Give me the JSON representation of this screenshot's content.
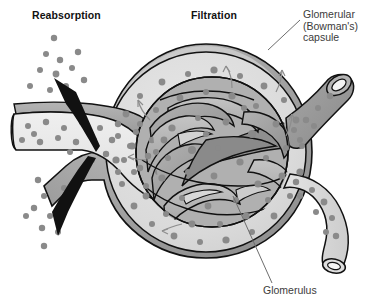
{
  "figure": {
    "background_color": "#ffffff",
    "width": 377,
    "height": 306
  },
  "labels": {
    "reabsorption": "Reabsorption",
    "filtration": "Filtration",
    "capsule_line1": "Glomerular",
    "capsule_line2": "(Bowman's)",
    "capsule_line3": "capsule",
    "glomerulus": "Glomerulus"
  },
  "colors": {
    "outline": "#000000",
    "capsule_outer": "#9a9a9a",
    "capsule_space": "#dedede",
    "capillary_light": "#bdbdbd",
    "capillary_mid": "#a3a3a3",
    "capillary_dark": "#8d8d8d",
    "tubule_fill": "#e8e8e8",
    "tubule_top": "#9d9d9d",
    "arteriole_dark": "#949494",
    "arteriole_light": "#dcdcdc",
    "solute_dot": "#8a8a8a",
    "arrow_black": "#111111",
    "leader_line": "#6d6d6d",
    "label_text_bold": "#111111",
    "label_text": "#3b3b3b"
  },
  "structures": [
    {
      "name": "proximal-tubule",
      "position": "left",
      "shade": "light"
    },
    {
      "name": "glomerular-capsule",
      "position": "center",
      "shade": "mid"
    },
    {
      "name": "capsular-space",
      "position": "center",
      "shade": "light"
    },
    {
      "name": "glomerulus-capillary-tuft",
      "position": "center",
      "shade": "dark"
    },
    {
      "name": "afferent-arteriole",
      "position": "upper-right",
      "shade": "dark"
    },
    {
      "name": "efferent-arteriole",
      "position": "lower-right",
      "shade": "light"
    }
  ],
  "arrows": {
    "reabsorption_upper": "solute movement out of tubule, up-left",
    "reabsorption_lower": "solute movement out of tubule, down-left",
    "filtration_small": "filtrate flow into capsular space"
  },
  "leader_lines": [
    {
      "name": "capsule-leader",
      "from": "label",
      "to": "capsule-wall"
    },
    {
      "name": "glomerulus-leader",
      "from": "label",
      "to": "capillary-tuft"
    }
  ]
}
